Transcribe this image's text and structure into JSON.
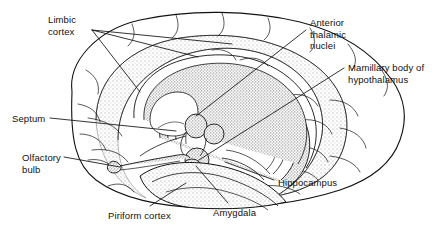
{
  "figure": {
    "background_color": "#ffffff",
    "ink_color": "#111111",
    "stipple_color": "#8a8a8a",
    "width": 441,
    "height": 234
  },
  "labels": [
    {
      "id": "limbic-cortex",
      "text": "Limbic\ncortex",
      "x": 48,
      "y": 14
    },
    {
      "id": "anterior-thalamic-nuclei",
      "text": "Anterior\nthalamic\nnuclei",
      "x": 310,
      "y": 17
    },
    {
      "id": "mamillary-body",
      "text": "Mamillary body of\nhypothalamus",
      "x": 348,
      "y": 62
    },
    {
      "id": "septum",
      "text": "Septum",
      "x": 12,
      "y": 113
    },
    {
      "id": "olfactory-bulb",
      "text": "Olfactory\nbulb",
      "x": 22,
      "y": 152
    },
    {
      "id": "hippocampus",
      "text": "Hippocampus",
      "x": 278,
      "y": 177
    },
    {
      "id": "amygdala",
      "text": "Amygdala",
      "x": 213,
      "y": 207
    },
    {
      "id": "piriform-cortex",
      "text": "Piriform cortex",
      "x": 108,
      "y": 210
    }
  ],
  "structures": [
    {
      "id": "cerebral-cortex",
      "name": "Cerebral cortex outline"
    },
    {
      "id": "limbic-lobe",
      "name": "Limbic cortex band (cingulate + parahippocampal)"
    },
    {
      "id": "fornix",
      "name": "Fornix arc"
    },
    {
      "id": "hippocampal-formation",
      "name": "Hippocampus"
    },
    {
      "id": "anterior-thalamus",
      "name": "Anterior thalamic nuclei"
    },
    {
      "id": "mamillary-body",
      "name": "Mamillary body"
    },
    {
      "id": "amygdala-body",
      "name": "Amygdala"
    },
    {
      "id": "olfactory-tract",
      "name": "Olfactory bulb and tract"
    },
    {
      "id": "piriform-area",
      "name": "Piriform cortex"
    },
    {
      "id": "septal-area",
      "name": "Septum"
    }
  ],
  "leader_lines": [
    {
      "id": "limbic-cortex-1",
      "from": [
        92,
        30
      ],
      "to": [
        232,
        44
      ]
    },
    {
      "id": "limbic-cortex-2",
      "from": [
        92,
        30
      ],
      "to": [
        198,
        57
      ]
    },
    {
      "id": "limbic-cortex-3",
      "from": [
        92,
        30
      ],
      "to": [
        140,
        92
      ]
    },
    {
      "id": "anterior-thalamic",
      "from": [
        306,
        30
      ],
      "to": [
        196,
        116
      ]
    },
    {
      "id": "mamillary-leader",
      "from": [
        344,
        68
      ],
      "to": [
        199,
        160
      ]
    },
    {
      "id": "septum-leader",
      "from": [
        50,
        118
      ],
      "to": [
        176,
        131
      ]
    },
    {
      "id": "olfactory-leader",
      "from": [
        64,
        157
      ],
      "to": [
        120,
        167
      ]
    },
    {
      "id": "hippocampus-leader",
      "from": [
        274,
        180
      ],
      "to": [
        225,
        162
      ]
    },
    {
      "id": "amygdala-leader",
      "from": [
        228,
        203
      ],
      "to": [
        196,
        166
      ]
    },
    {
      "id": "piriform-leader",
      "from": [
        150,
        206
      ],
      "to": [
        186,
        183
      ]
    }
  ]
}
